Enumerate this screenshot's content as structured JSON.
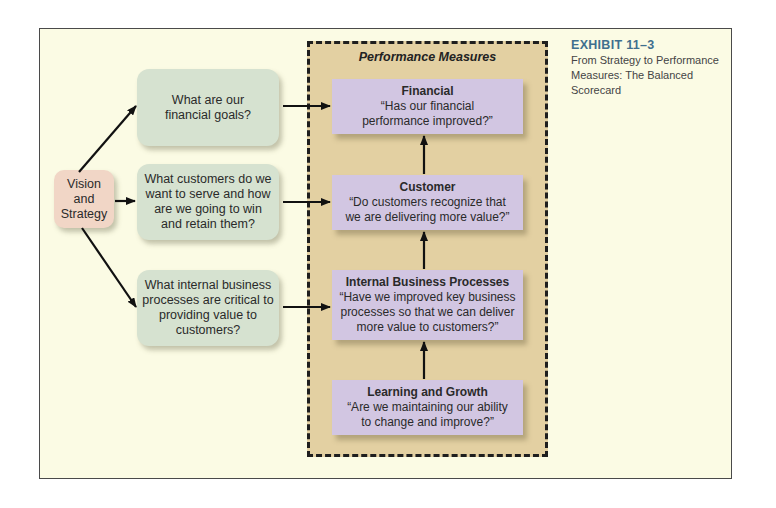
{
  "exhibit": {
    "number": "EXHIBIT 11–3",
    "caption": "From Strategy to Performance Measures: The Balanced Scorecard"
  },
  "vision": {
    "label": "Vision and Strategy"
  },
  "questions": [
    {
      "text": "What are our financial goals?"
    },
    {
      "text": "What customers do we want to serve and how are we going to win and retain them?"
    },
    {
      "text": "What internal business processes are critical to providing value to customers?"
    }
  ],
  "performance_measures": {
    "title": "Performance Measures",
    "items": [
      {
        "title": "Financial",
        "quote": "“Has our financial performance improved?”"
      },
      {
        "title": "Customer",
        "quote": "“Do customers recognize that we are delivering more value?”"
      },
      {
        "title": "Internal Business Processes",
        "quote": "“Have we improved key business processes so that we can deliver more value to customers?”"
      },
      {
        "title": "Learning and Growth",
        "quote": "“Are we maintaining our ability to change and improve?”"
      }
    ]
  },
  "colors": {
    "frame_bg": "#fbfbe4",
    "measures_bg": "#e3d0a2",
    "question_box": "#d6e2d0",
    "measure_box": "#d2c6e2",
    "vision_box": "#f1d6c6",
    "exhibit_accent": "#3f6f8e"
  }
}
